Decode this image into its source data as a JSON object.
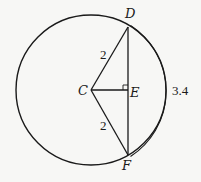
{
  "diagram": {
    "type": "geometry",
    "colors": {
      "background": "#f7f7f5",
      "stroke": "#1a1a1a"
    },
    "circle": {
      "center_label": "C",
      "cx": 91,
      "cy": 90,
      "r": 75
    },
    "points": {
      "C": {
        "label": "C",
        "x": 91,
        "y": 90
      },
      "D": {
        "label": "D",
        "x": 128,
        "y": 27
      },
      "E": {
        "label": "E",
        "x": 128,
        "y": 90
      },
      "F": {
        "label": "F",
        "x": 128,
        "y": 155
      }
    },
    "segments": [
      {
        "from": "C",
        "to": "D",
        "label": "2"
      },
      {
        "from": "C",
        "to": "F",
        "label": "2"
      },
      {
        "from": "D",
        "to": "F",
        "label": ""
      },
      {
        "from": "C",
        "to": "E",
        "label": ""
      }
    ],
    "right_angle_marker": "E",
    "arc": {
      "from": "D",
      "to": "F",
      "label": "3.4"
    },
    "labels": {
      "C": "C",
      "D": "D",
      "E": "E",
      "F": "F",
      "radius_CD": "2",
      "radius_CF": "2",
      "arc_DF": "3.4"
    }
  }
}
